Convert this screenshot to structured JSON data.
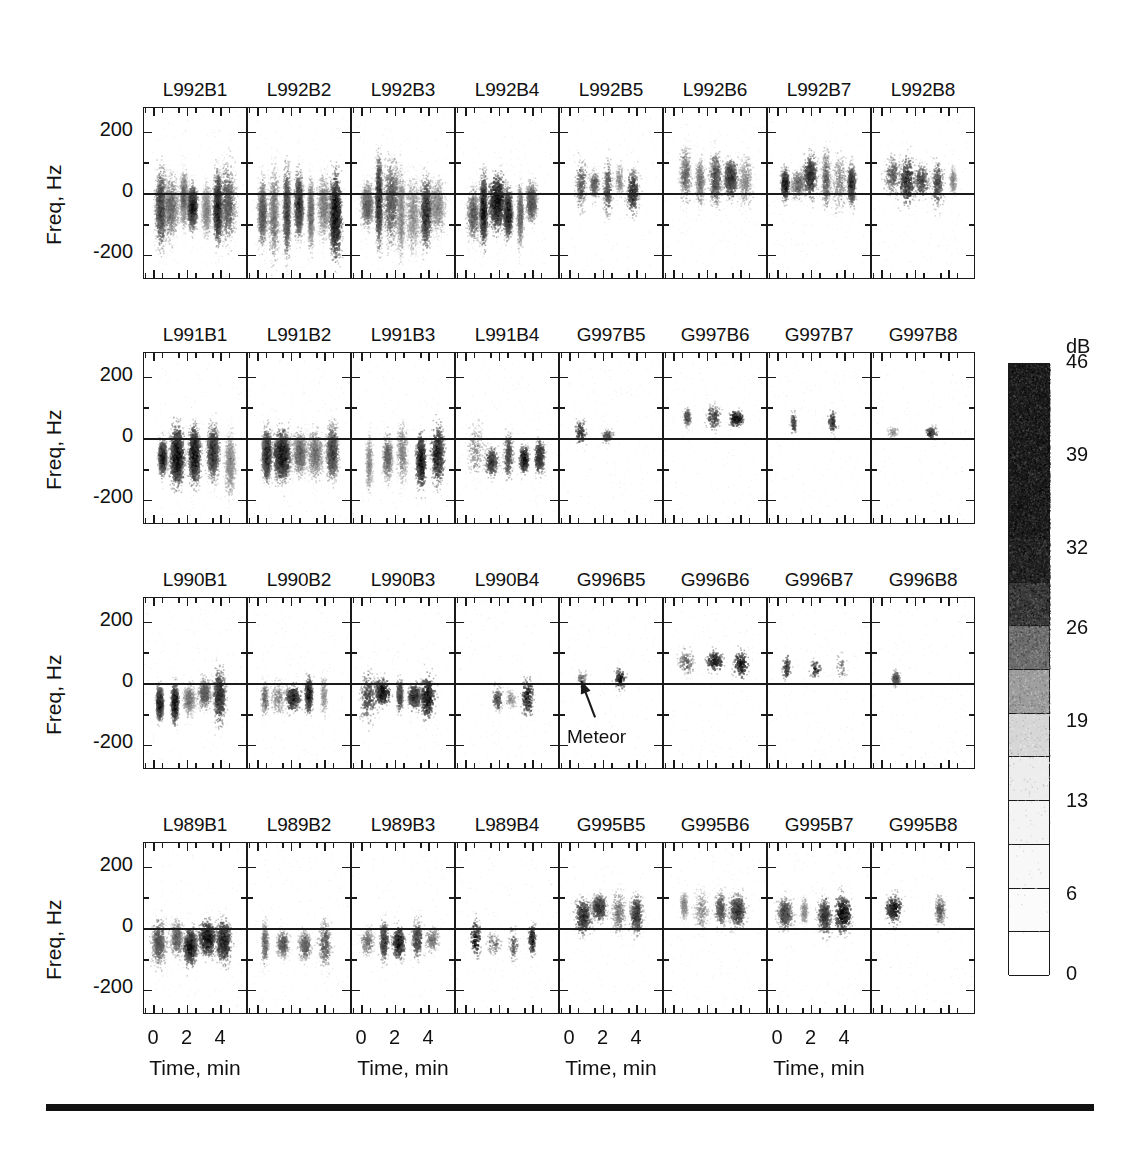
{
  "figure": {
    "background": "#ffffff",
    "ink": "#1a1a1a",
    "annotation": {
      "label": "Meteor"
    },
    "colorbar": {
      "unit": "dB",
      "ticks": [
        "46",
        "39",
        "32",
        "26",
        "19",
        "13",
        "6",
        "0"
      ],
      "tick_values": [
        46,
        39,
        32,
        26,
        19,
        13,
        6,
        0
      ],
      "segment_levels": [
        46,
        43,
        39,
        36,
        32,
        29,
        26,
        23,
        19,
        16,
        13,
        9,
        6,
        3,
        0
      ],
      "segment_colors": [
        "#1c1c1c",
        "#1c1c1c",
        "#1c1c1c",
        "#1c1c1c",
        "#222222",
        "#3a3a3a",
        "#6e6e6e",
        "#9d9d9d",
        "#d6d6d6",
        "#ededed",
        "#f4f4f4",
        "#f8f8f8",
        "#fbfbfb",
        "#ffffff"
      ]
    }
  },
  "chart_data": {
    "type": "heatmap",
    "title": "",
    "subtitle": "",
    "xlabel": "Time, min",
    "ylabel": "Freq, Hz",
    "zlabel": "dB",
    "xlim": [
      -0.6,
      5.6
    ],
    "ylim": [
      -280,
      280
    ],
    "zlim": [
      0,
      46
    ],
    "xticks": [
      0,
      2,
      4
    ],
    "xticklabels": [
      "0",
      "2",
      "4"
    ],
    "xminorticks": [
      -0.5,
      0.5,
      1.5,
      2.5,
      3.5,
      4.5,
      5.5
    ],
    "yticks": [
      200,
      0,
      -200
    ],
    "yticklabels": [
      "200",
      "0",
      "-200"
    ],
    "yminorticks": [
      100,
      -100
    ],
    "grid": false,
    "legend": "colorbar-right",
    "rows": 4,
    "cols": 8,
    "panels": [
      {
        "row": 0,
        "col": 0,
        "title": "L992B1",
        "density": "very-high",
        "bias": -40,
        "spread": 105,
        "tstart": 0.35,
        "tend": 4.4,
        "blobs": 7
      },
      {
        "row": 0,
        "col": 1,
        "title": "L992B2",
        "density": "very-high",
        "bias": -45,
        "spread": 110,
        "tstart": 0.3,
        "tend": 4.6,
        "blobs": 7
      },
      {
        "row": 0,
        "col": 2,
        "title": "L992B3",
        "density": "very-high",
        "bias": -45,
        "spread": 108,
        "tstart": 0.3,
        "tend": 4.5,
        "blobs": 7
      },
      {
        "row": 0,
        "col": 3,
        "title": "L992B4",
        "density": "high",
        "bias": -50,
        "spread": 100,
        "tstart": 0.4,
        "tend": 3.9,
        "blobs": 6
      },
      {
        "row": 0,
        "col": 4,
        "title": "L992B5",
        "density": "medium",
        "bias": 25,
        "spread": 75,
        "tstart": 0.7,
        "tend": 3.8,
        "blobs": 5
      },
      {
        "row": 0,
        "col": 5,
        "title": "L992B6",
        "density": "medium-high",
        "bias": 45,
        "spread": 70,
        "tstart": 0.6,
        "tend": 4.2,
        "blobs": 5
      },
      {
        "row": 0,
        "col": 6,
        "title": "L992B7",
        "density": "medium-high",
        "bias": 40,
        "spread": 72,
        "tstart": 0.4,
        "tend": 4.4,
        "blobs": 6
      },
      {
        "row": 0,
        "col": 7,
        "title": "L992B8",
        "density": "medium",
        "bias": 45,
        "spread": 65,
        "tstart": 0.55,
        "tend": 4.3,
        "blobs": 5
      },
      {
        "row": 1,
        "col": 0,
        "title": "L991B1",
        "density": "high",
        "bias": -60,
        "spread": 80,
        "tstart": 0.45,
        "tend": 4.5,
        "blobs": 5
      },
      {
        "row": 1,
        "col": 1,
        "title": "L991B2",
        "density": "high",
        "bias": -60,
        "spread": 80,
        "tstart": 0.45,
        "tend": 4.5,
        "blobs": 5
      },
      {
        "row": 1,
        "col": 2,
        "title": "L991B3",
        "density": "medium-high",
        "bias": -60,
        "spread": 78,
        "tstart": 0.45,
        "tend": 4.5,
        "blobs": 5
      },
      {
        "row": 1,
        "col": 3,
        "title": "L991B4",
        "density": "medium",
        "bias": -55,
        "spread": 72,
        "tstart": 0.5,
        "tend": 4.4,
        "blobs": 5
      },
      {
        "row": 1,
        "col": 4,
        "title": "G997B5",
        "density": "very-low",
        "bias": 15,
        "spread": 35,
        "tstart": 0.6,
        "tend": 2.2,
        "blobs": 2
      },
      {
        "row": 1,
        "col": 5,
        "title": "G997B6",
        "density": "low",
        "bias": 75,
        "spread": 40,
        "tstart": 0.8,
        "tend": 3.8,
        "blobs": 3
      },
      {
        "row": 1,
        "col": 6,
        "title": "G997B7",
        "density": "very-low",
        "bias": 55,
        "spread": 30,
        "tstart": 0.9,
        "tend": 3.2,
        "blobs": 2
      },
      {
        "row": 1,
        "col": 7,
        "title": "G997B8",
        "density": "very-low",
        "bias": 25,
        "spread": 28,
        "tstart": 0.7,
        "tend": 3.0,
        "blobs": 2
      },
      {
        "row": 2,
        "col": 0,
        "title": "L990B1",
        "density": "medium-high",
        "bias": -45,
        "spread": 70,
        "tstart": 0.35,
        "tend": 4.0,
        "blobs": 5
      },
      {
        "row": 2,
        "col": 1,
        "title": "L990B2",
        "density": "medium",
        "bias": -45,
        "spread": 68,
        "tstart": 0.35,
        "tend": 4.0,
        "blobs": 5
      },
      {
        "row": 2,
        "col": 2,
        "title": "L990B3",
        "density": "medium",
        "bias": -45,
        "spread": 68,
        "tstart": 0.35,
        "tend": 4.0,
        "blobs": 5
      },
      {
        "row": 2,
        "col": 3,
        "title": "L990B4",
        "density": "low",
        "bias": -40,
        "spread": 50,
        "tstart": 1.8,
        "tend": 3.6,
        "blobs": 3
      },
      {
        "row": 2,
        "col": 4,
        "title": "G996B5",
        "density": "very-low",
        "bias": 10,
        "spread": 30,
        "tstart": 0.7,
        "tend": 3.0,
        "blobs": 2
      },
      {
        "row": 2,
        "col": 5,
        "title": "G996B6",
        "density": "low",
        "bias": 70,
        "spread": 45,
        "tstart": 0.8,
        "tend": 4.0,
        "blobs": 3
      },
      {
        "row": 2,
        "col": 6,
        "title": "G996B7",
        "density": "very-low",
        "bias": 55,
        "spread": 45,
        "tstart": 0.6,
        "tend": 3.8,
        "blobs": 3
      },
      {
        "row": 2,
        "col": 7,
        "title": "G996B8",
        "density": "very-low",
        "bias": 15,
        "spread": 22,
        "tstart": 0.6,
        "tend": 1.2,
        "blobs": 1
      },
      {
        "row": 3,
        "col": 0,
        "title": "L989B1",
        "density": "medium-high",
        "bias": -45,
        "spread": 68,
        "tstart": 0.3,
        "tend": 4.2,
        "blobs": 5
      },
      {
        "row": 3,
        "col": 1,
        "title": "L989B2",
        "density": "medium",
        "bias": -45,
        "spread": 62,
        "tstart": 0.35,
        "tend": 4.0,
        "blobs": 4
      },
      {
        "row": 3,
        "col": 2,
        "title": "L989B3",
        "density": "medium",
        "bias": -45,
        "spread": 65,
        "tstart": 0.35,
        "tend": 4.2,
        "blobs": 5
      },
      {
        "row": 3,
        "col": 3,
        "title": "L989B4",
        "density": "low",
        "bias": -40,
        "spread": 55,
        "tstart": 0.6,
        "tend": 4.0,
        "blobs": 4
      },
      {
        "row": 3,
        "col": 4,
        "title": "G995B5",
        "density": "medium",
        "bias": 55,
        "spread": 55,
        "tstart": 0.7,
        "tend": 4.0,
        "blobs": 4
      },
      {
        "row": 3,
        "col": 5,
        "title": "G995B6",
        "density": "medium",
        "bias": 60,
        "spread": 55,
        "tstart": 0.6,
        "tend": 3.8,
        "blobs": 4
      },
      {
        "row": 3,
        "col": 6,
        "title": "G995B7",
        "density": "medium",
        "bias": 55,
        "spread": 55,
        "tstart": 0.5,
        "tend": 3.8,
        "blobs": 4
      },
      {
        "row": 3,
        "col": 7,
        "title": "G995B8",
        "density": "low",
        "bias": 55,
        "spread": 45,
        "tstart": 0.6,
        "tend": 3.4,
        "blobs": 2
      }
    ],
    "row_axis_labels": [
      {
        "row": 0,
        "ylabel": "Freq, Hz",
        "yticklabels": [
          "200",
          "0",
          "-200"
        ]
      },
      {
        "row": 1,
        "ylabel": "Freq, Hz",
        "yticklabels": [
          "200",
          "0",
          "-200"
        ]
      },
      {
        "row": 2,
        "ylabel": "Freq, Hz",
        "yticklabels": [
          "200",
          "0",
          "-200"
        ]
      },
      {
        "row": 3,
        "ylabel": "Freq, Hz",
        "yticklabels": [
          "200",
          "0",
          "-200"
        ]
      }
    ],
    "xaxis_groups": [
      {
        "cols": [
          0,
          1
        ],
        "ticklabels": [
          "0",
          "2",
          "4"
        ],
        "title": "Time, min"
      },
      {
        "cols": [
          2,
          3
        ],
        "ticklabels": [
          "0",
          "2",
          "4"
        ],
        "title": "Time, min"
      },
      {
        "cols": [
          4,
          5
        ],
        "ticklabels": [
          "0",
          "2",
          "4"
        ],
        "title": "Time, min"
      },
      {
        "cols": [
          6,
          7
        ],
        "ticklabels": [
          "0",
          "2",
          "4"
        ],
        "title": "Time, min"
      }
    ]
  }
}
